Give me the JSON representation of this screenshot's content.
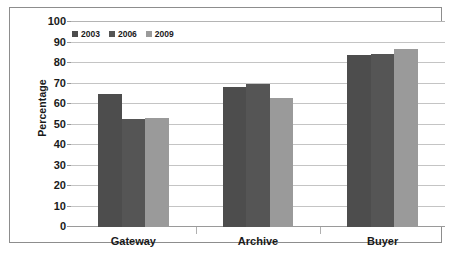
{
  "chart_data": {
    "type": "bar",
    "title": "",
    "xlabel": "",
    "ylabel": "Percentage",
    "ylim": [
      0,
      100
    ],
    "yticks": [
      0,
      10,
      20,
      30,
      40,
      50,
      60,
      70,
      80,
      90,
      100
    ],
    "grid": true,
    "legend_position": "top-left",
    "categories": [
      "Gateway",
      "Archive",
      "Buyer"
    ],
    "series": [
      {
        "name": "2003",
        "color": "#4d4d4d",
        "values": [
          65,
          68.5,
          84
        ]
      },
      {
        "name": "2006",
        "color": "#555555",
        "values": [
          52.5,
          70,
          84.5
        ]
      },
      {
        "name": "2009",
        "color": "#9a9a9a",
        "values": [
          53,
          63,
          87
        ]
      }
    ]
  }
}
